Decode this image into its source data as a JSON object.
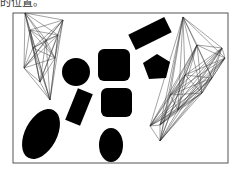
{
  "caption": {
    "text": "的位置。"
  },
  "figure": {
    "frame": {
      "x": 13,
      "y": 13,
      "w": 215,
      "h": 150,
      "stroke": "#555555"
    },
    "fill_color": "#000000",
    "line_color": "#333333",
    "shapes": [
      {
        "id": "circle",
        "type": "circle",
        "cx": 76,
        "cy": 72,
        "r": 14
      },
      {
        "id": "rounded-square-top",
        "type": "rect",
        "x": 98,
        "y": 49,
        "w": 32,
        "h": 32,
        "rx": 6,
        "rotate": 0
      },
      {
        "id": "rotated-rect",
        "type": "rect",
        "x": 130,
        "y": 25,
        "w": 40,
        "h": 17,
        "rx": 0,
        "rotate": -26
      },
      {
        "id": "pentagon",
        "type": "polygon",
        "points": "157,54 170,62 166,78 149,79 143,63"
      },
      {
        "id": "tilted-rect",
        "type": "rect",
        "x": 71,
        "y": 90,
        "w": 16,
        "h": 34,
        "rx": 0,
        "rotate": 22
      },
      {
        "id": "rounded-square-mid",
        "type": "rect",
        "x": 101,
        "y": 88,
        "w": 31,
        "h": 29,
        "rx": 6,
        "rotate": 0
      },
      {
        "id": "ellipse-large",
        "type": "ellipse",
        "cx": 41,
        "cy": 134,
        "rx": 16,
        "ry": 27,
        "rotate": 28
      },
      {
        "id": "ellipse-small",
        "type": "ellipse",
        "cx": 111,
        "cy": 145,
        "rx": 12,
        "ry": 17,
        "rotate": 0
      }
    ],
    "wireframes": [
      {
        "id": "left-polytope",
        "vertices": [
          [
            25,
            13
          ],
          [
            63,
            20
          ],
          [
            46,
            40
          ],
          [
            33,
            48
          ],
          [
            55,
            58
          ],
          [
            24,
            68
          ],
          [
            40,
            82
          ],
          [
            50,
            100
          ],
          [
            30,
            30
          ],
          [
            58,
            35
          ]
        ]
      },
      {
        "id": "right-polytope",
        "vertices": [
          [
            183,
            17
          ],
          [
            222,
            48
          ],
          [
            225,
            58
          ],
          [
            212,
            78
          ],
          [
            202,
            93
          ],
          [
            185,
            75
          ],
          [
            170,
            95
          ],
          [
            160,
            125
          ],
          [
            150,
            126
          ],
          [
            160,
            141
          ],
          [
            197,
            45
          ],
          [
            178,
            110
          ]
        ]
      }
    ]
  }
}
